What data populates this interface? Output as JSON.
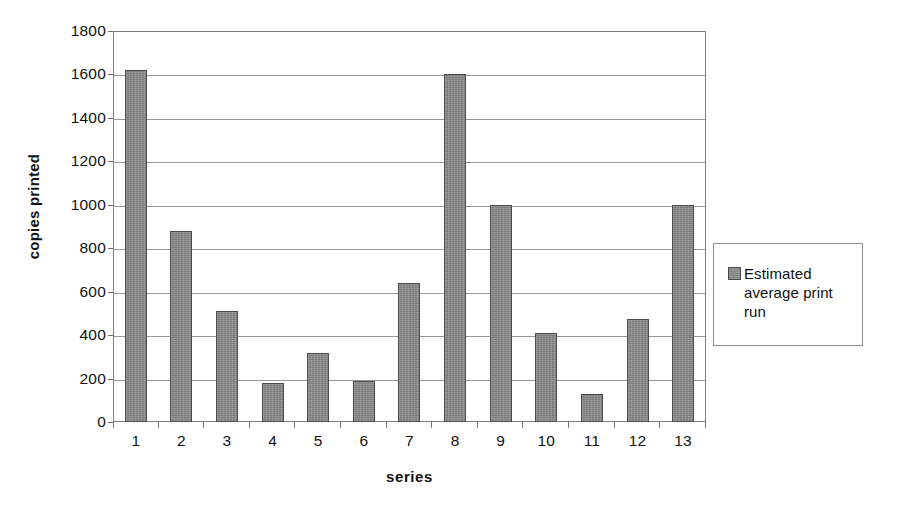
{
  "chart_data": {
    "type": "bar",
    "title": "",
    "xlabel": "series",
    "ylabel": "copies printed",
    "categories": [
      "1",
      "2",
      "3",
      "4",
      "5",
      "6",
      "7",
      "8",
      "9",
      "10",
      "11",
      "12",
      "13"
    ],
    "values": [
      1620,
      880,
      510,
      180,
      320,
      190,
      640,
      1600,
      1000,
      410,
      130,
      475,
      1000
    ],
    "series": [
      {
        "name": "Estimated average print run",
        "values": [
          1620,
          880,
          510,
          180,
          320,
          190,
          640,
          1600,
          1000,
          410,
          130,
          475,
          1000
        ]
      }
    ],
    "ylim": [
      0,
      1800
    ],
    "y_ticks": [
      0,
      200,
      400,
      600,
      800,
      1000,
      1200,
      1400,
      1600,
      1800
    ],
    "y_tick_labels": [
      "0",
      "200",
      "400",
      "600",
      "800",
      "1000",
      "1200",
      "1400",
      "1600",
      "1800"
    ],
    "grid": true,
    "grid_axis": "y",
    "legend_position": "right",
    "legend_entries": [
      "Estimated average print run"
    ],
    "bar_color": "#8a8a8a",
    "bar_border_color": "#4c4c4c",
    "axis_color": "#7d7d7d",
    "gridline_color": "#9a9a9a",
    "background_color": "#ffffff"
  },
  "legend": {
    "swatch_name": "legend-color-swatch",
    "label": "Estimated average print run"
  }
}
